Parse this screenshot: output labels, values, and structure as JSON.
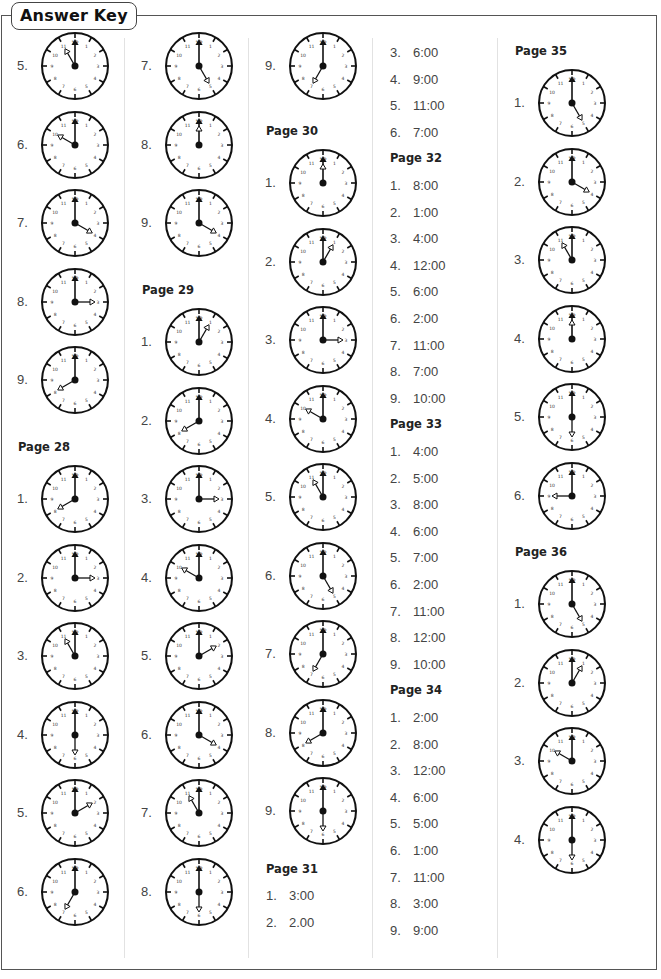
{
  "title": "Answer Key",
  "columns": [
    {
      "x": 0,
      "blocks": [
        {
          "type": "clocks",
          "y": 30,
          "items": [
            {
              "label": "5.",
              "hour": 11
            },
            {
              "label": "6.",
              "hour": 10
            },
            {
              "label": "7.",
              "hour": 4
            },
            {
              "label": "8.",
              "hour": 3
            },
            {
              "label": "9.",
              "hour": 8
            }
          ]
        },
        {
          "type": "heading",
          "y": 440,
          "text": "Page 28"
        },
        {
          "type": "clocks",
          "y": 463,
          "items": [
            {
              "label": "1.",
              "hour": 8
            },
            {
              "label": "2.",
              "hour": 3
            },
            {
              "label": "3.",
              "hour": 11
            },
            {
              "label": "4.",
              "hour": 6
            },
            {
              "label": "5.",
              "hour": 2
            },
            {
              "label": "6.",
              "hour": 7
            }
          ]
        }
      ]
    },
    {
      "x": 124,
      "blocks": [
        {
          "type": "clocks",
          "y": 30,
          "items": [
            {
              "label": "7.",
              "hour": 5
            },
            {
              "label": "8.",
              "hour": 12
            },
            {
              "label": "9.",
              "hour": 4
            }
          ]
        },
        {
          "type": "heading",
          "y": 283,
          "text": "Page 29"
        },
        {
          "type": "clocks",
          "y": 306,
          "items": [
            {
              "label": "1.",
              "hour": 1
            },
            {
              "label": "2.",
              "hour": 8
            },
            {
              "label": "3.",
              "hour": 3
            },
            {
              "label": "4.",
              "hour": 10
            },
            {
              "label": "5.",
              "hour": 2
            },
            {
              "label": "6.",
              "hour": 4
            },
            {
              "label": "7.",
              "hour": 11
            },
            {
              "label": "8.",
              "hour": 6
            }
          ]
        }
      ]
    },
    {
      "x": 248,
      "blocks": [
        {
          "type": "clocks",
          "y": 30,
          "items": [
            {
              "label": "9.",
              "hour": 7
            }
          ]
        },
        {
          "type": "heading",
          "y": 124,
          "text": "Page 30"
        },
        {
          "type": "clocks",
          "y": 147,
          "items": [
            {
              "label": "1.",
              "hour": 12
            },
            {
              "label": "2.",
              "hour": 1
            },
            {
              "label": "3.",
              "hour": 3
            },
            {
              "label": "4.",
              "hour": 10
            },
            {
              "label": "5.",
              "hour": 11
            },
            {
              "label": "6.",
              "hour": 5
            },
            {
              "label": "7.",
              "hour": 7
            },
            {
              "label": "8.",
              "hour": 8
            },
            {
              "label": "9.",
              "hour": 6
            }
          ]
        },
        {
          "type": "heading",
          "y": 862,
          "text": "Page 31"
        },
        {
          "type": "text",
          "y": 888,
          "items": [
            {
              "label": "1.",
              "value": "3:00"
            },
            {
              "label": "2.",
              "value": "2.00"
            }
          ]
        }
      ]
    },
    {
      "x": 372,
      "blocks": [
        {
          "type": "text",
          "y": 45,
          "items": [
            {
              "label": "3.",
              "value": "6:00"
            },
            {
              "label": "4.",
              "value": "9:00"
            },
            {
              "label": "5.",
              "value": "11:00"
            },
            {
              "label": "6.",
              "value": "7:00"
            }
          ]
        },
        {
          "type": "heading",
          "y": 151,
          "text": "Page 32"
        },
        {
          "type": "text",
          "y": 178,
          "items": [
            {
              "label": "1.",
              "value": "8:00"
            },
            {
              "label": "2.",
              "value": "1:00"
            },
            {
              "label": "3.",
              "value": "4:00"
            },
            {
              "label": "4.",
              "value": "12:00"
            },
            {
              "label": "5.",
              "value": "6:00"
            },
            {
              "label": "6.",
              "value": "2:00"
            },
            {
              "label": "7.",
              "value": "11:00"
            },
            {
              "label": "8.",
              "value": "7:00"
            },
            {
              "label": "9.",
              "value": "10:00"
            }
          ]
        },
        {
          "type": "heading",
          "y": 417,
          "text": "Page 33"
        },
        {
          "type": "text",
          "y": 444,
          "items": [
            {
              "label": "1.",
              "value": "4:00"
            },
            {
              "label": "2.",
              "value": "5:00"
            },
            {
              "label": "3.",
              "value": "8:00"
            },
            {
              "label": "4.",
              "value": "6:00"
            },
            {
              "label": "5.",
              "value": "7:00"
            },
            {
              "label": "6.",
              "value": "2:00"
            },
            {
              "label": "7.",
              "value": "11:00"
            },
            {
              "label": "8.",
              "value": "12:00"
            },
            {
              "label": "9.",
              "value": "10:00"
            }
          ]
        },
        {
          "type": "heading",
          "y": 683,
          "text": "Page 34"
        },
        {
          "type": "text",
          "y": 710,
          "items": [
            {
              "label": "1.",
              "value": "2:00"
            },
            {
              "label": "2.",
              "value": "8:00"
            },
            {
              "label": "3.",
              "value": "12:00"
            },
            {
              "label": "4.",
              "value": "6:00"
            },
            {
              "label": "5.",
              "value": "5:00"
            },
            {
              "label": "6.",
              "value": "1:00"
            },
            {
              "label": "7.",
              "value": "11:00"
            },
            {
              "label": "8.",
              "value": "3:00"
            },
            {
              "label": "9.",
              "value": "9:00"
            }
          ]
        }
      ]
    },
    {
      "x": 497,
      "blocks": [
        {
          "type": "heading",
          "y": 44,
          "text": "Page 35"
        },
        {
          "type": "clocks",
          "y": 67,
          "items": [
            {
              "label": "1.",
              "hour": 5
            },
            {
              "label": "2.",
              "hour": 4
            },
            {
              "label": "3.",
              "hour": 11
            },
            {
              "label": "4.",
              "hour": 12
            },
            {
              "label": "5.",
              "hour": 6
            },
            {
              "label": "6.",
              "hour": 9
            }
          ]
        },
        {
          "type": "heading",
          "y": 545,
          "text": "Page 36"
        },
        {
          "type": "clocks",
          "y": 568,
          "items": [
            {
              "label": "1.",
              "hour": 5
            },
            {
              "label": "2.",
              "hour": 1
            },
            {
              "label": "3.",
              "hour": 10
            },
            {
              "label": "4.",
              "hour": 6
            }
          ]
        }
      ]
    }
  ]
}
